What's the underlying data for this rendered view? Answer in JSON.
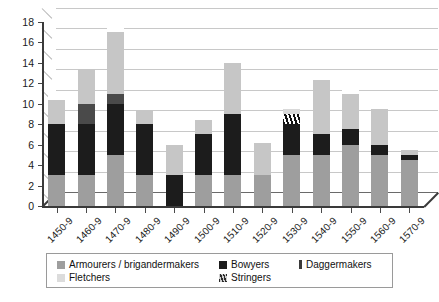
{
  "chart_data": {
    "type": "bar",
    "subtype": "stacked-bar-3d",
    "title": "",
    "xlabel": "",
    "ylabel": "",
    "ylim": [
      0,
      18
    ],
    "ytick_step": 2,
    "yticks": [
      "0",
      "2",
      "4",
      "6",
      "8",
      "10",
      "12",
      "14",
      "16",
      "18"
    ],
    "grid": true,
    "legend_position": "bottom",
    "categories": [
      "1450-9",
      "1460-9",
      "1470-9",
      "1480-9",
      "1490-9",
      "1500-9",
      "1510-9",
      "1520-9",
      "1530-9",
      "1540-9",
      "1550-9",
      "1560-9",
      "1570-9"
    ],
    "series": [
      {
        "name": "Armourers / brigandermakers",
        "color": "#9e9e9e",
        "values": [
          3,
          3,
          5,
          3,
          0,
          3,
          3,
          3,
          5,
          5,
          6,
          5,
          4.5
        ]
      },
      {
        "name": "Bowyers",
        "color": "#1c1c1c",
        "values": [
          5,
          5,
          5,
          5,
          3,
          4,
          6,
          0,
          3,
          2,
          1.5,
          1,
          0.5
        ]
      },
      {
        "name": "Daggermakers",
        "color": "#4a4a4a",
        "values": [
          0,
          2,
          1,
          0,
          0,
          0,
          0,
          0,
          0,
          0,
          0,
          0,
          0
        ]
      },
      {
        "name": "Fletchers",
        "color": "#c6c6c6",
        "values": [
          2.4,
          3.4,
          6,
          1.4,
          3,
          1.4,
          5,
          3.2,
          0,
          5.3,
          3.5,
          3.5,
          0.5
        ]
      },
      {
        "name": "Stringers",
        "color": "#8a8a8a",
        "values": [
          0,
          0,
          0,
          0,
          0,
          0,
          0,
          0,
          1,
          0,
          0,
          0,
          0
        ]
      }
    ],
    "totals": [
      10.4,
      13.4,
      17,
      9.4,
      6,
      8.4,
      14,
      6.2,
      9,
      12.3,
      11,
      9.5,
      5.5
    ]
  },
  "legend": {
    "items": [
      {
        "label": "Armourers / brigandermakers",
        "swatch": "#9e9e9e",
        "shape": "square"
      },
      {
        "label": "Bowyers",
        "swatch": "#1c1c1c",
        "shape": "square"
      },
      {
        "label": "Daggermakers",
        "swatch": "#3a3a3a",
        "shape": "narrow"
      },
      {
        "label": "Fletchers",
        "swatch": "#dcdcdc",
        "shape": "square"
      },
      {
        "label": "Stringers",
        "swatch": "#8a8a8a",
        "shape": "square"
      }
    ]
  },
  "caption": {
    "text": ""
  }
}
